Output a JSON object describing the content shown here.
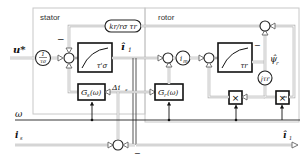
{
  "diagram": {
    "regions": {
      "stator": "stator",
      "rotor": "rotor"
    },
    "signals": {
      "input_voltage": "u*",
      "stator_current_est": "î",
      "stator_current_sub": "1",
      "omega": "ω",
      "measured_current": "i",
      "measured_current_sub": "s",
      "current_error": "Δi",
      "current_error_sub": "s",
      "output_current": "î",
      "output_current_sub": "1",
      "rotor_flux": "ψ̂",
      "rotor_flux_sub": "r",
      "magnetizing_current": "i",
      "magnetizing_current_sub": "m",
      "minus_sign": "−"
    },
    "blocks": {
      "gain_in": "1/τσ",
      "gain_in_num": "1",
      "gain_in_den": "τσ",
      "stator_integrator_label": "τ'σ",
      "flux_gain": "kr/rσ τr",
      "stator_gain": "G",
      "stator_gain_sub": "s",
      "stator_gain_arg": "(ω)",
      "rotor_gain": "G",
      "rotor_gain_sub": "r",
      "rotor_gain_arg": "(ω)",
      "rotor_integrator_label": "τr",
      "rotor_time_const": "jτr",
      "multiplier_1": "×",
      "multiplier_2": "×"
    },
    "colors": {
      "region_border": "#c8c8c8",
      "block_border": "#111111",
      "double_line": "#aaaaaa"
    }
  }
}
